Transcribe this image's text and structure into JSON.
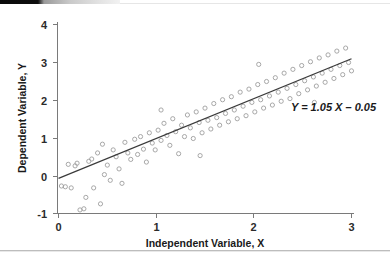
{
  "chart_data": {
    "type": "scatter",
    "title": "",
    "xlabel": "Independent Variable, X",
    "ylabel": "Dependent Variable, Y",
    "xlim": [
      -0.05,
      3.05
    ],
    "ylim": [
      -1,
      4
    ],
    "xticks": [
      0,
      1,
      2,
      3
    ],
    "xtick_labels": [
      "0",
      "1",
      "2",
      "3"
    ],
    "yticks": [
      -1,
      0,
      1,
      2,
      3,
      4
    ],
    "ytick_labels": [
      "-1",
      "0",
      "1",
      "2",
      "3",
      "4"
    ],
    "grid": false,
    "legend": null,
    "annotations": [
      {
        "text": "Y = 1.05 X – 0.05",
        "x": 2.38,
        "y": 1.72,
        "style": "bold-italic"
      }
    ],
    "fit_line": {
      "label": "Y = 1.05 X – 0.05",
      "slope": 1.05,
      "intercept": -0.05,
      "x_start": 0.0,
      "x_end": 3.0,
      "y_start": -0.05,
      "y_end": 3.1,
      "color": "#3a3a3a"
    },
    "marker": {
      "shape": "open-circle",
      "radius": 2.1,
      "color": "#9e9e9e",
      "fill": "none"
    },
    "n_points": 104,
    "points": [
      [
        0.03,
        -0.25
      ],
      [
        0.07,
        -0.27
      ],
      [
        0.1,
        0.32
      ],
      [
        0.13,
        -0.3
      ],
      [
        0.17,
        0.28
      ],
      [
        0.19,
        0.35
      ],
      [
        0.22,
        -0.88
      ],
      [
        0.26,
        -0.85
      ],
      [
        0.28,
        -0.55
      ],
      [
        0.31,
        0.4
      ],
      [
        0.34,
        0.46
      ],
      [
        0.36,
        -0.3
      ],
      [
        0.4,
        0.62
      ],
      [
        0.43,
        -0.72
      ],
      [
        0.47,
        0.05
      ],
      [
        0.5,
        0.3
      ],
      [
        0.53,
        -0.1
      ],
      [
        0.56,
        0.7
      ],
      [
        0.59,
        0.52
      ],
      [
        0.62,
        0.2
      ],
      [
        0.65,
        -0.18
      ],
      [
        0.68,
        0.9
      ],
      [
        0.71,
        0.62
      ],
      [
        0.74,
        0.45
      ],
      [
        0.78,
        0.98
      ],
      [
        0.81,
        0.58
      ],
      [
        0.84,
        1.05
      ],
      [
        0.87,
        0.72
      ],
      [
        0.9,
        0.38
      ],
      [
        0.93,
        1.15
      ],
      [
        0.96,
        0.88
      ],
      [
        0.99,
        0.7
      ],
      [
        1.02,
        1.22
      ],
      [
        1.05,
        0.95
      ],
      [
        1.08,
        1.4
      ],
      [
        1.11,
        1.08
      ],
      [
        1.14,
        0.82
      ],
      [
        1.17,
        1.52
      ],
      [
        1.2,
        1.18
      ],
      [
        1.23,
        0.6
      ],
      [
        1.26,
        1.35
      ],
      [
        1.29,
        1.05
      ],
      [
        1.32,
        1.62
      ],
      [
        1.35,
        1.28
      ],
      [
        1.38,
        1.0
      ],
      [
        1.41,
        1.7
      ],
      [
        1.44,
        1.42
      ],
      [
        1.47,
        1.15
      ],
      [
        1.5,
        1.8
      ],
      [
        1.53,
        1.48
      ],
      [
        1.56,
        1.25
      ],
      [
        1.59,
        1.92
      ],
      [
        1.62,
        1.55
      ],
      [
        1.65,
        1.35
      ],
      [
        1.68,
        2.02
      ],
      [
        1.71,
        1.66
      ],
      [
        1.74,
        1.44
      ],
      [
        1.77,
        2.1
      ],
      [
        1.8,
        1.75
      ],
      [
        1.83,
        1.52
      ],
      [
        1.86,
        2.22
      ],
      [
        1.89,
        1.85
      ],
      [
        1.92,
        1.6
      ],
      [
        1.95,
        2.3
      ],
      [
        1.98,
        1.95
      ],
      [
        2.01,
        1.7
      ],
      [
        2.04,
        2.42
      ],
      [
        2.07,
        2.02
      ],
      [
        2.1,
        1.8
      ],
      [
        2.13,
        2.5
      ],
      [
        2.16,
        2.12
      ],
      [
        2.19,
        1.88
      ],
      [
        2.22,
        2.6
      ],
      [
        2.25,
        2.22
      ],
      [
        2.28,
        1.98
      ],
      [
        2.31,
        2.72
      ],
      [
        2.34,
        2.32
      ],
      [
        2.37,
        2.05
      ],
      [
        2.4,
        2.82
      ],
      [
        2.43,
        2.42
      ],
      [
        2.46,
        2.18
      ],
      [
        2.49,
        2.92
      ],
      [
        2.52,
        2.52
      ],
      [
        2.55,
        2.28
      ],
      [
        2.58,
        3.02
      ],
      [
        2.61,
        2.62
      ],
      [
        2.64,
        2.38
      ],
      [
        2.67,
        3.12
      ],
      [
        2.7,
        2.72
      ],
      [
        2.73,
        2.48
      ],
      [
        2.76,
        3.2
      ],
      [
        2.79,
        2.82
      ],
      [
        2.82,
        2.58
      ],
      [
        2.85,
        3.3
      ],
      [
        2.88,
        2.92
      ],
      [
        2.91,
        2.68
      ],
      [
        2.94,
        3.38
      ],
      [
        2.97,
        3.0
      ],
      [
        3.0,
        2.78
      ],
      [
        2.05,
        2.95
      ],
      [
        1.45,
        0.55
      ],
      [
        0.45,
        0.85
      ],
      [
        2.62,
        1.95
      ],
      [
        1.05,
        1.75
      ]
    ]
  },
  "axes": {
    "x_label": "Independent Variable, X",
    "y_label": "Dependent Variable, Y"
  },
  "decoration": {
    "top_bar": "black-header-bar",
    "bottom_rule": "page-divider-rule"
  }
}
